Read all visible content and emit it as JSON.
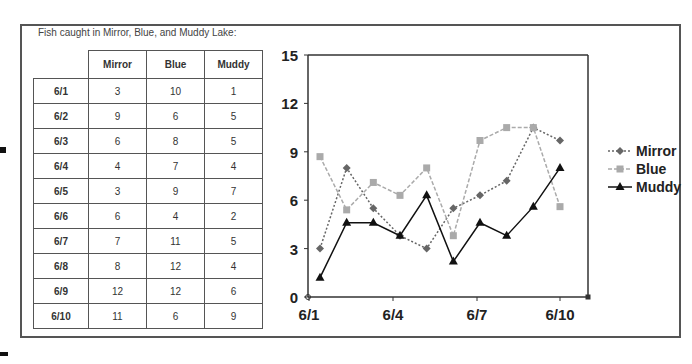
{
  "caption": "Fish caught in Mirror, Blue, and Muddy Lake:",
  "table": {
    "headers": [
      "",
      "Mirror",
      "Blue",
      "Muddy"
    ],
    "rows": [
      {
        "date": "6/1",
        "mirror": "3",
        "blue": "10",
        "muddy": "1"
      },
      {
        "date": "6/2",
        "mirror": "9",
        "blue": "6",
        "muddy": "5"
      },
      {
        "date": "6/3",
        "mirror": "6",
        "blue": "8",
        "muddy": "5"
      },
      {
        "date": "6/4",
        "mirror": "4",
        "blue": "7",
        "muddy": "4"
      },
      {
        "date": "6/5",
        "mirror": "3",
        "blue": "9",
        "muddy": "7"
      },
      {
        "date": "6/6",
        "mirror": "6",
        "blue": "4",
        "muddy": "2"
      },
      {
        "date": "6/7",
        "mirror": "7",
        "blue": "11",
        "muddy": "5"
      },
      {
        "date": "6/8",
        "mirror": "8",
        "blue": "12",
        "muddy": "4"
      },
      {
        "date": "6/9",
        "mirror": "12",
        "blue": "12",
        "muddy": "6"
      },
      {
        "date": "6/10",
        "mirror": "11",
        "blue": "6",
        "muddy": "9"
      }
    ]
  },
  "chart_data": {
    "type": "line",
    "title": "",
    "xlabel": "",
    "ylabel": "",
    "categories": [
      "6/1",
      "6/2",
      "6/3",
      "6/4",
      "6/5",
      "6/6",
      "6/7",
      "6/8",
      "6/9",
      "6/10"
    ],
    "x_tick_labels": [
      "6/1",
      "6/4",
      "6/7",
      "6/10"
    ],
    "y_ticks": [
      0,
      3,
      6,
      9,
      12,
      15
    ],
    "ylim": [
      0,
      15
    ],
    "grid": false,
    "legend_position": "right",
    "series": [
      {
        "name": "Mirror",
        "marker": "diamond",
        "line": "dotted",
        "color": "#666666",
        "values": [
          3,
          8,
          5.5,
          3.8,
          3,
          5.5,
          6.3,
          7.2,
          10.5,
          9.7
        ]
      },
      {
        "name": "Blue",
        "marker": "square",
        "line": "dashed",
        "color": "#aaaaaa",
        "values": [
          8.7,
          5.4,
          7.1,
          6.3,
          8,
          3.8,
          9.7,
          10.5,
          10.5,
          5.6
        ]
      },
      {
        "name": "Muddy",
        "marker": "triangle",
        "line": "solid",
        "color": "#111111",
        "values": [
          1.2,
          4.6,
          4.6,
          3.8,
          6.3,
          2.2,
          4.6,
          3.8,
          5.6,
          8
        ]
      }
    ]
  }
}
